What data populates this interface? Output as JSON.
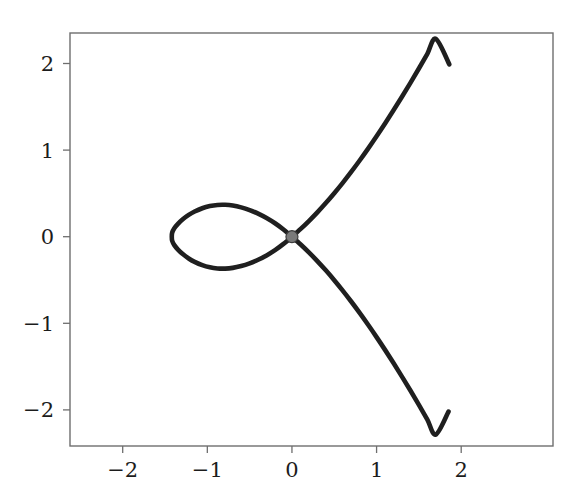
{
  "figure": {
    "background_color": "#ffffff",
    "width": 582,
    "height": 504
  },
  "axes": {
    "spine_color": "#6e6e6e",
    "spine_width": 1.4,
    "tick_color": "#6e6e6e",
    "frame_left": 70,
    "frame_right": 553,
    "frame_top": 33,
    "frame_bottom": 446,
    "x_ticks": [
      {
        "value": -2,
        "label": "−2",
        "px": 122.7
      },
      {
        "value": -1,
        "label": "−1",
        "px": 207.3
      },
      {
        "value": 0,
        "label": "0",
        "px": 292.0
      },
      {
        "value": 1,
        "label": "1",
        "px": 376.6
      },
      {
        "value": 2,
        "label": "2",
        "px": 461.2
      }
    ],
    "y_ticks": [
      {
        "value": 2,
        "label": "2",
        "px": 63.5
      },
      {
        "value": 1,
        "label": "1",
        "px": 150.1
      },
      {
        "value": 0,
        "label": "0",
        "px": 236.7
      },
      {
        "value": -1,
        "label": "−1",
        "px": 323.3
      },
      {
        "value": -2,
        "label": "−2",
        "px": 409.9
      }
    ]
  },
  "chart_data": {
    "type": "line",
    "title": "",
    "xlabel": "",
    "ylabel": "",
    "xlim": [
      -2.62,
      3.08
    ],
    "ylim": [
      -2.42,
      2.36
    ],
    "grid": false,
    "legend": null,
    "curve_name": "nodal-cubic",
    "curve_description": "Nodal cubic (alpha curve) with a self-intersection node at the origin; closed loop to the left of the node and two branches extending to the upper right and lower right.",
    "line_color": "#1f1f1f",
    "line_width": 4.6,
    "node_marker": {
      "label": "node",
      "x": 0,
      "y": 0,
      "color": "#7a7a7a",
      "edge_color": "#3c3c3c",
      "radius_px": 6
    },
    "annotations": [],
    "key_points": {
      "node": [
        0,
        0
      ],
      "loop_leftmost": [
        -1.42,
        0
      ],
      "loop_top": [
        -0.79,
        0.36
      ],
      "loop_bottom": [
        -0.79,
        -0.36
      ],
      "upper_branch_end": [
        1.86,
        1.99
      ],
      "lower_branch_end": [
        1.85,
        -2.02
      ],
      "node_tangent_slopes": [
        0.8,
        -0.8
      ]
    },
    "series": [
      {
        "name": "nodal-cubic-loop",
        "points": [
          [
            0.0,
            0.0
          ],
          [
            -0.1,
            0.0833
          ],
          [
            -0.2,
            0.1551
          ],
          [
            -0.3,
            0.2159
          ],
          [
            -0.4,
            0.2665
          ],
          [
            -0.5,
            0.3072
          ],
          [
            -0.6,
            0.3383
          ],
          [
            -0.7,
            0.3598
          ],
          [
            -0.79,
            0.3681
          ],
          [
            -0.88,
            0.3667
          ],
          [
            -0.97,
            0.3538
          ],
          [
            -1.06,
            0.3288
          ],
          [
            -1.15,
            0.2905
          ],
          [
            -1.22,
            0.2512
          ],
          [
            -1.29,
            0.2009
          ],
          [
            -1.35,
            0.1455
          ],
          [
            -1.39,
            0.0974
          ],
          [
            -1.415,
            0.0483
          ],
          [
            -1.42,
            0.0
          ],
          [
            -1.415,
            -0.0483
          ],
          [
            -1.39,
            -0.0974
          ],
          [
            -1.35,
            -0.1455
          ],
          [
            -1.29,
            -0.2009
          ],
          [
            -1.22,
            -0.2512
          ],
          [
            -1.15,
            -0.2905
          ],
          [
            -1.06,
            -0.3288
          ],
          [
            -0.97,
            -0.3538
          ],
          [
            -0.88,
            -0.3667
          ],
          [
            -0.79,
            -0.3681
          ],
          [
            -0.7,
            -0.3598
          ],
          [
            -0.6,
            -0.3383
          ],
          [
            -0.5,
            -0.3072
          ],
          [
            -0.4,
            -0.2665
          ],
          [
            -0.3,
            -0.2159
          ],
          [
            -0.2,
            -0.1551
          ],
          [
            -0.1,
            -0.0833
          ],
          [
            0.0,
            0.0
          ]
        ]
      },
      {
        "name": "nodal-cubic-upper-branch",
        "points": [
          [
            0.0,
            0.0
          ],
          [
            0.1,
            0.0872
          ],
          [
            0.2,
            0.1809
          ],
          [
            0.3,
            0.2814
          ],
          [
            0.4,
            0.3886
          ],
          [
            0.5,
            0.5023
          ],
          [
            0.6,
            0.6223
          ],
          [
            0.7,
            0.7482
          ],
          [
            0.8,
            0.8799
          ],
          [
            0.9,
            1.0171
          ],
          [
            1.0,
            1.1594
          ],
          [
            1.1,
            1.3068
          ],
          [
            1.2,
            1.4589
          ],
          [
            1.3,
            1.6156
          ],
          [
            1.4,
            1.7767
          ],
          [
            1.5,
            1.942
          ],
          [
            1.6,
            2.1113
          ],
          [
            1.7,
            2.2846
          ],
          [
            1.86,
            1.99
          ]
        ]
      },
      {
        "name": "nodal-cubic-lower-branch",
        "points": [
          [
            0.0,
            0.0
          ],
          [
            0.1,
            -0.0872
          ],
          [
            0.2,
            -0.1809
          ],
          [
            0.3,
            -0.2814
          ],
          [
            0.4,
            -0.3886
          ],
          [
            0.5,
            -0.5023
          ],
          [
            0.6,
            -0.6223
          ],
          [
            0.7,
            -0.7482
          ],
          [
            0.8,
            -0.8799
          ],
          [
            0.9,
            -1.0171
          ],
          [
            1.0,
            -1.1594
          ],
          [
            1.1,
            -1.3068
          ],
          [
            1.2,
            -1.4589
          ],
          [
            1.3,
            -1.6156
          ],
          [
            1.4,
            -1.7767
          ],
          [
            1.5,
            -1.942
          ],
          [
            1.6,
            -2.1113
          ],
          [
            1.7,
            -2.2846
          ],
          [
            1.85,
            -2.02
          ]
        ]
      }
    ]
  }
}
